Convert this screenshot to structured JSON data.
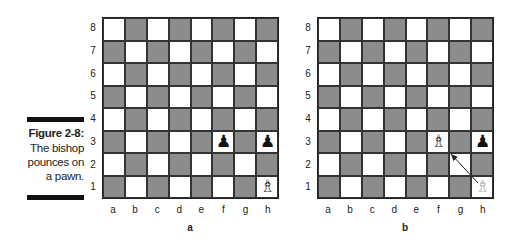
{
  "caption": {
    "title": "Figure 2-8:",
    "lines": [
      "The bishop",
      "pounces on",
      "a pawn."
    ]
  },
  "ranks": [
    "8",
    "7",
    "6",
    "5",
    "4",
    "3",
    "2",
    "1"
  ],
  "files": [
    "a",
    "b",
    "c",
    "d",
    "e",
    "f",
    "g",
    "h"
  ],
  "colors": {
    "dark_square": "#8c8c8c",
    "light_square": "#ffffff"
  },
  "boards": [
    {
      "label": "a",
      "pieces": [
        {
          "square": "f3",
          "piece": "black-pawn",
          "glyph": "♟",
          "style": "black"
        },
        {
          "square": "h3",
          "piece": "black-pawn",
          "glyph": "♟",
          "style": "black"
        },
        {
          "square": "h1",
          "piece": "white-bishop",
          "glyph": "♗",
          "style": "white"
        }
      ]
    },
    {
      "label": "b",
      "pieces": [
        {
          "square": "f3",
          "piece": "white-bishop",
          "glyph": "♗",
          "style": "white"
        },
        {
          "square": "h3",
          "piece": "black-pawn",
          "glyph": "♟",
          "style": "black"
        },
        {
          "square": "h1",
          "piece": "white-bishop-ghost",
          "glyph": "♗",
          "style": "ghost"
        }
      ],
      "arrow": {
        "from": "h1",
        "to": "f3"
      }
    }
  ]
}
